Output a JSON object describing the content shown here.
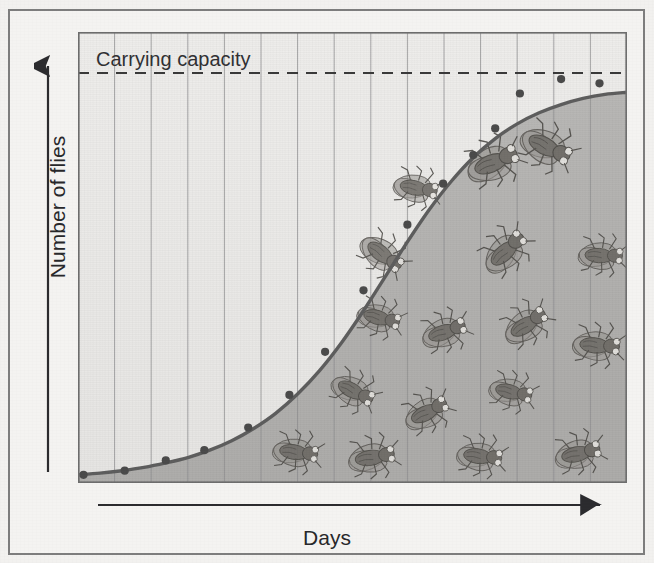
{
  "figure": {
    "y_axis_label": "Number of flies",
    "x_axis_label": "Days",
    "annotation_label": "Carrying capacity"
  },
  "colors": {
    "frame_border": "#7d7d7d",
    "paper_background": "#f2f1ef",
    "plot_light": "#e9e8e6",
    "plot_shaded": "#b5b4b2",
    "curve": "#585858",
    "gridline": "#8e8e90",
    "dashed_line": "#3a3a3a",
    "text": "#2b2b2e",
    "fly_body": "#6e6b66",
    "fly_wing": "#9a9793",
    "fly_eye": "#e8e6e2"
  },
  "chart_data": {
    "type": "line",
    "title": "",
    "xlabel": "Days",
    "ylabel": "Number of flies",
    "annotations": [
      {
        "text": "Carrying capacity",
        "type": "horizontal-dashed-line",
        "y": 100
      }
    ],
    "grid": {
      "vertical": true,
      "horizontal": false,
      "vertical_count": 14
    },
    "legend": null,
    "xlim": [
      0,
      100
    ],
    "ylim": [
      0,
      110
    ],
    "series": [
      {
        "name": "Fly population (logistic growth)",
        "curve": "sigmoid",
        "x": [
          0,
          4,
          8,
          12,
          16,
          20,
          24,
          28,
          32,
          36,
          40,
          44,
          48,
          52,
          56,
          60,
          64,
          68,
          72,
          76,
          80,
          84,
          88,
          92,
          96,
          100
        ],
        "y": [
          2,
          2.4,
          3,
          3.8,
          4.9,
          6.2,
          8.0,
          10.3,
          13.3,
          17.0,
          21.7,
          27.4,
          34.2,
          42.0,
          50.4,
          58.8,
          66.7,
          73.6,
          79.4,
          84.0,
          87.6,
          90.3,
          92.3,
          93.8,
          94.8,
          95.3
        ]
      }
    ],
    "data_points": [
      {
        "x": 1.0,
        "y": 2.0
      },
      {
        "x": 8.5,
        "y": 3.0
      },
      {
        "x": 16.0,
        "y": 5.5
      },
      {
        "x": 23.0,
        "y": 8.0
      },
      {
        "x": 31.0,
        "y": 13.5
      },
      {
        "x": 38.5,
        "y": 21.5
      },
      {
        "x": 45.0,
        "y": 32.0
      },
      {
        "x": 52.0,
        "y": 47.0
      },
      {
        "x": 60.0,
        "y": 63.0
      },
      {
        "x": 66.5,
        "y": 73.0
      },
      {
        "x": 72.0,
        "y": 80.0
      },
      {
        "x": 76.0,
        "y": 86.5
      },
      {
        "x": 80.5,
        "y": 95.0
      },
      {
        "x": 88.0,
        "y": 98.5
      },
      {
        "x": 95.0,
        "y": 97.5
      }
    ],
    "carrying_capacity": 100,
    "flies_drawn": 17
  },
  "flies": [
    {
      "x": 497,
      "y": 160,
      "rotate": -22,
      "scale": 1.2
    },
    {
      "x": 420,
      "y": 188,
      "rotate": 12,
      "scale": 1.0
    },
    {
      "x": 551,
      "y": 148,
      "rotate": 28,
      "scale": 1.18
    },
    {
      "x": 605,
      "y": 255,
      "rotate": 4,
      "scale": 1.0
    },
    {
      "x": 508,
      "y": 248,
      "rotate": -42,
      "scale": 1.1
    },
    {
      "x": 386,
      "y": 256,
      "rotate": 38,
      "scale": 1.05
    },
    {
      "x": 383,
      "y": 318,
      "rotate": 16,
      "scale": 0.98
    },
    {
      "x": 448,
      "y": 330,
      "rotate": -18,
      "scale": 1.02
    },
    {
      "x": 529,
      "y": 322,
      "rotate": -32,
      "scale": 1.05
    },
    {
      "x": 601,
      "y": 345,
      "rotate": 6,
      "scale": 1.06
    },
    {
      "x": 357,
      "y": 392,
      "rotate": 28,
      "scale": 1.0
    },
    {
      "x": 430,
      "y": 410,
      "rotate": -26,
      "scale": 1.03
    },
    {
      "x": 515,
      "y": 392,
      "rotate": 14,
      "scale": 0.98
    },
    {
      "x": 300,
      "y": 452,
      "rotate": 9,
      "scale": 1.02
    },
    {
      "x": 376,
      "y": 456,
      "rotate": -8,
      "scale": 1.05
    },
    {
      "x": 484,
      "y": 456,
      "rotate": 8,
      "scale": 1.02
    },
    {
      "x": 582,
      "y": 452,
      "rotate": -12,
      "scale": 1.04
    }
  ]
}
